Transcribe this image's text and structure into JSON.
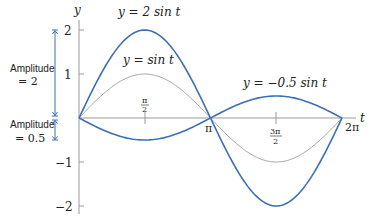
{
  "chart_data": {
    "type": "line",
    "title": "",
    "xlabel": "t",
    "ylabel": "y",
    "xlim": [
      0,
      6.2832
    ],
    "ylim": [
      -2,
      2
    ],
    "grid": false,
    "x_ticks": [
      {
        "value": 1.5708,
        "label_num": "π",
        "label_den": "2"
      },
      {
        "value": 3.1416,
        "label": "π"
      },
      {
        "value": 4.7124,
        "label_num": "3π",
        "label_den": "2"
      },
      {
        "value": 6.2832,
        "label": "2π"
      }
    ],
    "y_ticks": [
      {
        "value": 2,
        "label": "2"
      },
      {
        "value": 1,
        "label": "1"
      },
      {
        "value": -1,
        "label": "−1"
      },
      {
        "value": -2,
        "label": "−2"
      }
    ],
    "series": [
      {
        "name": "y = 2 sin t",
        "amplitude": 2,
        "color": "#3d6fb6",
        "width": 1.6,
        "x": [
          0,
          0.7854,
          1.5708,
          2.3562,
          3.1416,
          3.927,
          4.7124,
          5.4978,
          6.2832
        ],
        "values": [
          0,
          1.414,
          2,
          1.414,
          0,
          -1.414,
          -2,
          -1.414,
          0
        ]
      },
      {
        "name": "y = sin t",
        "amplitude": 1,
        "color": "#a8a8a8",
        "width": 1.0,
        "x": [
          0,
          0.7854,
          1.5708,
          2.3562,
          3.1416,
          3.927,
          4.7124,
          5.4978,
          6.2832
        ],
        "values": [
          0,
          0.707,
          1,
          0.707,
          0,
          -0.707,
          -1,
          -0.707,
          0
        ]
      },
      {
        "name": "y = −0.5 sin t",
        "amplitude": -0.5,
        "color": "#3d6fb6",
        "width": 1.6,
        "x": [
          0,
          0.7854,
          1.5708,
          2.3562,
          3.1416,
          3.927,
          4.7124,
          5.4978,
          6.2832
        ],
        "values": [
          0,
          -0.354,
          -0.5,
          -0.354,
          0,
          0.354,
          0.5,
          0.354,
          0
        ]
      }
    ],
    "annotations": [
      {
        "text": "y = 2 sin t",
        "near_series": 0
      },
      {
        "text": "y = sin t",
        "near_series": 1
      },
      {
        "text": "y = −0.5 sin t",
        "near_series": 2
      },
      {
        "text_line1": "Amplitude",
        "text_line2": "= 2",
        "span": [
          0,
          2
        ]
      },
      {
        "text_line1": "Amplitude",
        "text_line2": "= 0.5",
        "span": [
          -0.5,
          0
        ]
      }
    ]
  },
  "labels": {
    "axis_y": "y",
    "axis_t": "t",
    "curve_2sin": "y = 2 sin t",
    "curve_sin": "y = sin t",
    "curve_neg": "y = −0.5 sin t",
    "amp2_line1": "Amplitude",
    "amp2_line2": "= 2",
    "amp05_line1": "Amplitude",
    "amp05_line2": "= 0.5",
    "tick_2": "2",
    "tick_1": "1",
    "tick_m1": "−1",
    "tick_m2": "−2",
    "tick_pi_half_num": "π",
    "tick_pi_half_den": "2",
    "tick_pi": "π",
    "tick_3pi_half_num": "3π",
    "tick_3pi_half_den": "2",
    "tick_2pi": "2π"
  },
  "colors": {
    "curve_blue": "#3d6fb6",
    "curve_gray": "#a8a8a8",
    "axis": "#999999",
    "annotation_arrow": "#3d6fb6"
  }
}
